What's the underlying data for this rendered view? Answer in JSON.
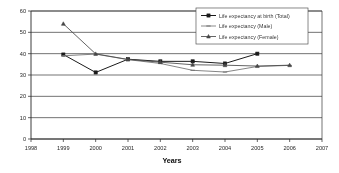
{
  "chart_data": {
    "type": "line",
    "title": "",
    "xlabel": "Years",
    "ylabel": "",
    "x": [
      1999,
      2000,
      2001,
      2002,
      2003,
      2004,
      2005,
      2006
    ],
    "xticks": [
      "1998",
      "1999",
      "2000",
      "2001",
      "2002",
      "2003",
      "2004",
      "2005",
      "2006",
      "2007"
    ],
    "yticks": [
      "0",
      "10",
      "20",
      "30",
      "40",
      "50",
      "60"
    ],
    "xlim": [
      1998,
      2007
    ],
    "ylim": [
      0,
      60
    ],
    "grid": true,
    "legend_position": "top-right",
    "series": [
      {
        "name": "Life expectancy at birth (Total)",
        "marker": "square",
        "color": "#1f1f1f",
        "x": [
          1999,
          2000,
          2001,
          2002,
          2003,
          2004,
          2005
        ],
        "values": [
          39.6,
          31.2,
          37.4,
          36.4,
          36.4,
          35.4,
          40.0
        ]
      },
      {
        "name": "Life expectancy (Male)",
        "marker": "none",
        "color": "#707070",
        "x": [
          1999,
          2000,
          2001,
          2002,
          2003,
          2004,
          2005,
          2006
        ],
        "values": [
          39.0,
          39.8,
          37.2,
          35.4,
          32.2,
          31.4,
          34.0,
          34.5
        ]
      },
      {
        "name": "Life expectancy (Female)",
        "marker": "triangle",
        "color": "#4a4a4a",
        "x": [
          1999,
          2000,
          2001,
          2002,
          2003,
          2004,
          2005,
          2006
        ],
        "values": [
          54.0,
          39.9,
          37.3,
          36.0,
          34.8,
          34.6,
          34.2,
          34.6
        ]
      }
    ]
  },
  "legend": {
    "entries": [
      {
        "label": "Life expectancy at birth (Total)"
      },
      {
        "label": "Life expectancy (Male)"
      },
      {
        "label": "Life expectancy (Female)"
      }
    ]
  },
  "axis": {
    "x_title": "Years"
  }
}
